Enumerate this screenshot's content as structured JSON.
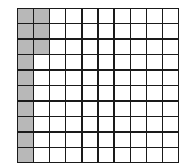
{
  "diagram": {
    "type": "hundred-grid",
    "rows": 10,
    "columns": 10,
    "total_cells": 100,
    "shaded_count": 13,
    "shaded_cells": [
      [
        0,
        0
      ],
      [
        1,
        0
      ],
      [
        2,
        0
      ],
      [
        3,
        0
      ],
      [
        4,
        0
      ],
      [
        5,
        0
      ],
      [
        6,
        0
      ],
      [
        7,
        0
      ],
      [
        8,
        0
      ],
      [
        9,
        0
      ],
      [
        0,
        1
      ],
      [
        1,
        1
      ],
      [
        2,
        1
      ]
    ],
    "colors": {
      "shaded": "#b8b8b8",
      "unshaded": "#ffffff",
      "lines": "#1a1a1a"
    }
  }
}
